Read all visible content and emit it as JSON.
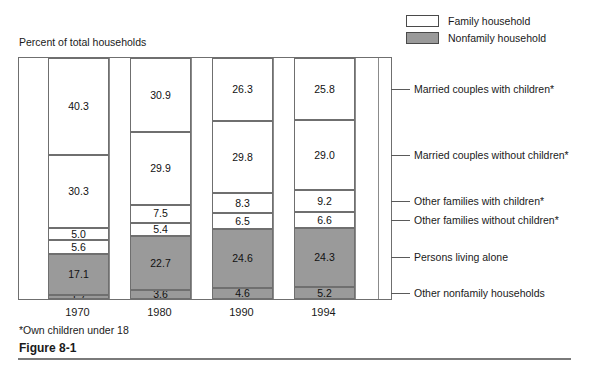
{
  "axis_caption": "Percent of total households",
  "footnote": "*Own children under 18",
  "figure_caption": "Figure 8-1",
  "legend": {
    "items": [
      {
        "label": "Family household",
        "swatch": "white",
        "color": "#ffffff"
      },
      {
        "label": "Nonfamily household",
        "swatch": "gray",
        "color": "#9a9a9a"
      }
    ]
  },
  "category_labels": [
    "Married couples with children*",
    "Married couples without children*",
    "Other families with children*",
    "Other families without children*",
    "Persons living alone",
    "Other nonfamily households"
  ],
  "chart_data": {
    "type": "bar",
    "subtype": "stacked-100-percent",
    "title": "Figure 8-1",
    "xlabel": "",
    "ylabel": "Percent of total households",
    "ylim": [
      0,
      100
    ],
    "grid": false,
    "legend_position": "top-right",
    "annotations": [
      "*Own children under 18"
    ],
    "categories": [
      "1970",
      "1980",
      "1990",
      "1994"
    ],
    "series": [
      {
        "name": "Married couples with children*",
        "type": "Family household",
        "color": "#ffffff",
        "values": [
          40.3,
          30.9,
          26.3,
          25.8
        ]
      },
      {
        "name": "Married couples without children*",
        "type": "Family household",
        "color": "#ffffff",
        "values": [
          30.3,
          29.9,
          29.8,
          29.0
        ]
      },
      {
        "name": "Other families with children*",
        "type": "Family household",
        "color": "#ffffff",
        "values": [
          5.0,
          7.5,
          8.3,
          9.2
        ]
      },
      {
        "name": "Other families without children*",
        "type": "Family household",
        "color": "#ffffff",
        "values": [
          5.6,
          5.4,
          6.5,
          6.6
        ]
      },
      {
        "name": "Persons living alone",
        "type": "Nonfamily household",
        "color": "#9a9a9a",
        "values": [
          17.1,
          22.7,
          24.6,
          24.3
        ]
      },
      {
        "name": "Other nonfamily households",
        "type": "Nonfamily household",
        "color": "#9a9a9a",
        "values": [
          1.7,
          3.6,
          4.6,
          5.2
        ]
      }
    ]
  },
  "columns": [
    {
      "year": "1970",
      "segments": [
        {
          "value": "40.3",
          "kind": "family"
        },
        {
          "value": "30.3",
          "kind": "family"
        },
        {
          "value": "5.0",
          "kind": "family"
        },
        {
          "value": "5.6",
          "kind": "family"
        },
        {
          "value": "17.1",
          "kind": "nonfamily"
        },
        {
          "value": "1.7",
          "kind": "nonfamily"
        }
      ]
    },
    {
      "year": "1980",
      "segments": [
        {
          "value": "30.9",
          "kind": "family"
        },
        {
          "value": "29.9",
          "kind": "family"
        },
        {
          "value": "7.5",
          "kind": "family"
        },
        {
          "value": "5.4",
          "kind": "family"
        },
        {
          "value": "22.7",
          "kind": "nonfamily"
        },
        {
          "value": "3.6",
          "kind": "nonfamily"
        }
      ]
    },
    {
      "year": "1990",
      "segments": [
        {
          "value": "26.3",
          "kind": "family"
        },
        {
          "value": "29.8",
          "kind": "family"
        },
        {
          "value": "8.3",
          "kind": "family"
        },
        {
          "value": "6.5",
          "kind": "family"
        },
        {
          "value": "24.6",
          "kind": "nonfamily"
        },
        {
          "value": "4.6",
          "kind": "nonfamily"
        }
      ]
    },
    {
      "year": "1994",
      "segments": [
        {
          "value": "25.8",
          "kind": "family"
        },
        {
          "value": "29.0",
          "kind": "family"
        },
        {
          "value": "9.2",
          "kind": "family"
        },
        {
          "value": "6.6",
          "kind": "family"
        },
        {
          "value": "24.3",
          "kind": "nonfamily"
        },
        {
          "value": "5.2",
          "kind": "nonfamily"
        }
      ]
    }
  ],
  "colors": {
    "family": "#ffffff",
    "nonfamily": "#9a9a9a",
    "stroke": "#6f6f6f",
    "text": "#111111"
  }
}
